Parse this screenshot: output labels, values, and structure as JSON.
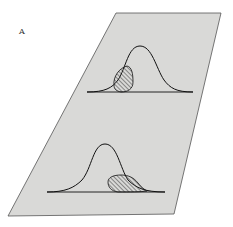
{
  "figure": {
    "panel_label": "A",
    "plane_fill": "#d9d9d7",
    "plane_stroke": "#555555",
    "curve_stroke": "#111111",
    "hatch_color": "#333333",
    "distributions": [
      {
        "name": "upper",
        "shaded_region": "left-tail"
      },
      {
        "name": "lower",
        "shaded_region": "right-tail"
      }
    ]
  }
}
